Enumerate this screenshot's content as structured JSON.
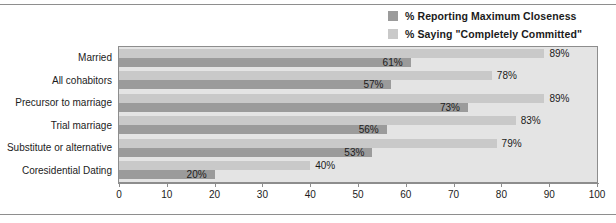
{
  "legend": {
    "items": [
      {
        "label": "% Reporting Maximum Closeness",
        "color": "#9b9b9b",
        "swatch_name": "legend-swatch-closeness"
      },
      {
        "label": "% Saying \"Completely Committed\"",
        "color": "#c9c9c9",
        "swatch_name": "legend-swatch-committed"
      }
    ]
  },
  "chart_data": {
    "type": "bar",
    "orientation": "horizontal",
    "title": "",
    "subtitle": "",
    "xlabel": "",
    "ylabel": "",
    "xlim": [
      0,
      100
    ],
    "xticks": [
      0,
      10,
      20,
      30,
      40,
      50,
      60,
      70,
      80,
      90,
      100
    ],
    "xtick_labels": [
      "0",
      "10",
      "20",
      "30",
      "40",
      "50",
      "60",
      "70",
      "80",
      "90",
      "100"
    ],
    "grid": false,
    "legend_position": "top-right",
    "categories": [
      "Married",
      "All cohabitors",
      "Precursor to marriage",
      "Trial marriage",
      "Substitute or alternative",
      "Coresidential Dating"
    ],
    "series": [
      {
        "name": "% Reporting Maximum Closeness",
        "color": "#9b9b9b",
        "values": [
          61,
          57,
          73,
          56,
          53,
          20
        ],
        "labels": [
          "61%",
          "57%",
          "73%",
          "56%",
          "53%",
          "20%"
        ]
      },
      {
        "name": "% Saying \"Completely Committed\"",
        "color": "#c9c9c9",
        "values": [
          89,
          78,
          89,
          83,
          79,
          40
        ],
        "labels": [
          "89%",
          "78%",
          "89%",
          "83%",
          "79%",
          "40%"
        ]
      }
    ]
  }
}
